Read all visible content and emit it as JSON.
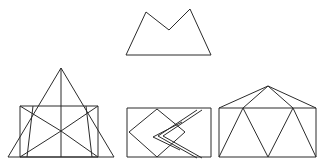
{
  "canvas": {
    "width": 324,
    "height": 168,
    "background_color": "#ffffff",
    "stroke_color": "#2b2b2b",
    "stroke_width": 1,
    "description": "Line-drawing worksheet: four black outline geometric figures on a plain white background, one centered on top and three in a row beneath."
  },
  "figures": [
    {
      "id": "top-mountain-polygon",
      "name": "double-peak-mountain",
      "label": "Double peak mountain outline",
      "position": "top-center",
      "polylines": [
        {
          "name": "mountain-outline",
          "closed": true,
          "points": "126,55 146,12 169,30 190,9 211,55"
        }
      ]
    },
    {
      "id": "bottom-left-triangle-rectangle",
      "name": "triangle-over-rectangle",
      "label": "Large triangle overlapping a rectangle with internal diagonals",
      "position": "bottom-left",
      "polylines": [
        {
          "name": "outer-triangle",
          "closed": true,
          "points": "8,157 61,68 114,157"
        },
        {
          "name": "inner-rectangle",
          "closed": true,
          "points": "20,106 98,106 98,157 20,157"
        },
        {
          "name": "apex-vertical",
          "closed": false,
          "points": "61,68 61,157"
        },
        {
          "name": "left-diagonal-up",
          "closed": false,
          "points": "20,106 61,131"
        },
        {
          "name": "right-diagonal-up",
          "closed": false,
          "points": "98,106 61,131"
        },
        {
          "name": "left-diagonal-down",
          "closed": false,
          "points": "20,157 61,131"
        },
        {
          "name": "right-diagonal-down",
          "closed": false,
          "points": "98,157 61,131"
        },
        {
          "name": "left-slant-edge",
          "closed": false,
          "points": "33,106 27,157"
        },
        {
          "name": "right-slant-edge",
          "closed": false,
          "points": "86,106 92,157"
        }
      ]
    },
    {
      "id": "bottom-middle-rectangle-zigzag",
      "name": "rectangle-with-rhombus-and-chevron",
      "label": "Rectangle containing a tilted rhombus and a narrow double-line chevron",
      "position": "bottom-center",
      "polylines": [
        {
          "name": "outer-rectangle",
          "closed": true,
          "points": "127,108 211,108 211,157 127,157"
        },
        {
          "name": "rhombus",
          "closed": true,
          "points": "129,132 157,109 185,132 157,157"
        },
        {
          "name": "chevron-outer",
          "closed": false,
          "points": "197,110 158,136 197,158"
        },
        {
          "name": "chevron-inner",
          "closed": false,
          "points": "202,110 163,136 202,158"
        },
        {
          "name": "chevron-small-outer",
          "closed": false,
          "points": "182,122 153,137 180,150"
        }
      ]
    },
    {
      "id": "bottom-right-house",
      "name": "rectangle-with-pentagon-roof",
      "label": "Rectangle topped by a wide triangular roof with internal zigzag triangles",
      "position": "bottom-right",
      "polylines": [
        {
          "name": "outer-rectangle",
          "closed": true,
          "points": "219,108 316,108 316,157 219,157"
        },
        {
          "name": "roof-left",
          "closed": false,
          "points": "219,108 268,86"
        },
        {
          "name": "roof-right",
          "closed": false,
          "points": "316,108 268,86"
        },
        {
          "name": "apex-to-left-node",
          "closed": false,
          "points": "268,86 243,108"
        },
        {
          "name": "apex-to-right-node",
          "closed": false,
          "points": "268,86 293,108"
        },
        {
          "name": "zig-1",
          "closed": false,
          "points": "219,157 243,108"
        },
        {
          "name": "zig-2",
          "closed": false,
          "points": "243,108 268,157"
        },
        {
          "name": "zig-3",
          "closed": false,
          "points": "268,157 293,108"
        },
        {
          "name": "zig-4",
          "closed": false,
          "points": "293,108 316,157"
        }
      ]
    }
  ]
}
